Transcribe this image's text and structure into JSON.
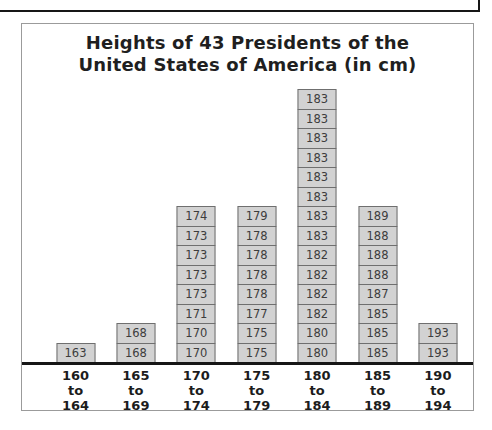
{
  "chart_data": {
    "type": "bar",
    "subtype": "unit-stacked-histogram",
    "title": "Heights of 43 Presidents of the United States of America (in cm)",
    "title_lines": [
      "Heights of 43 Presidents of the",
      "United States of America (in cm)"
    ],
    "total_count": 43,
    "categories": [
      "160 to 164",
      "165 to 169",
      "170 to 174",
      "175 to 179",
      "180 to 184",
      "185 to 189",
      "190 to 194"
    ],
    "stacks_bottom_to_top": [
      [
        163
      ],
      [
        168,
        168
      ],
      [
        170,
        170,
        171,
        173,
        173,
        173,
        173,
        174
      ],
      [
        175,
        175,
        177,
        178,
        178,
        178,
        178,
        179
      ],
      [
        180,
        180,
        182,
        182,
        182,
        182,
        183,
        183,
        183,
        183,
        183,
        183,
        183,
        183
      ],
      [
        185,
        185,
        185,
        187,
        188,
        188,
        188,
        189
      ],
      [
        193,
        193
      ]
    ],
    "counts": [
      1,
      2,
      8,
      8,
      14,
      8,
      2
    ],
    "xlabel": "",
    "ylabel": "",
    "legend": null,
    "grid": false,
    "colors": {
      "cell_fill": "#d2d2d2",
      "cell_border": "#6f6f6f",
      "cell_text": "#3d3d3d",
      "axis_line": "#161616",
      "frame_border": "#9b9b9b",
      "title_text": "#1f1f1f",
      "tick_text": "#1c1c1c",
      "background": "#ffffff"
    }
  }
}
